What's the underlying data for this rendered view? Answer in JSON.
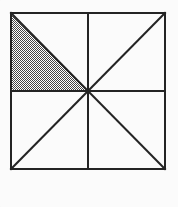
{
  "figure": {
    "name": "shaded-square-eighths",
    "background_color": "#fbfbfb",
    "line_color": "#242424",
    "line_width": 2,
    "shade_fill_color": "#a9a9a9",
    "shade_pattern": "halftone-checker-dither",
    "shade_dot_color": "#3a3a3a",
    "square": {
      "left": 11,
      "top": 13,
      "right": 165,
      "bottom": 169,
      "width": 154,
      "height": 156,
      "center_x": 88,
      "center_y": 91
    },
    "lines": [
      {
        "name": "square-border-top",
        "x1": 11,
        "y1": 13,
        "x2": 165,
        "y2": 13
      },
      {
        "name": "square-border-right",
        "x1": 165,
        "y1": 13,
        "x2": 165,
        "y2": 169
      },
      {
        "name": "square-border-bottom",
        "x1": 11,
        "y1": 169,
        "x2": 165,
        "y2": 169
      },
      {
        "name": "square-border-left",
        "x1": 11,
        "y1": 13,
        "x2": 11,
        "y2": 169
      },
      {
        "name": "horizontal-midline",
        "x1": 11,
        "y1": 91,
        "x2": 165,
        "y2": 91
      },
      {
        "name": "vertical-midline",
        "x1": 88,
        "y1": 13,
        "x2": 88,
        "y2": 169
      },
      {
        "name": "diagonal-tl-br",
        "x1": 11,
        "y1": 13,
        "x2": 165,
        "y2": 169
      },
      {
        "name": "diagonal-bl-tr",
        "x1": 11,
        "y1": 169,
        "x2": 165,
        "y2": 13
      }
    ],
    "shaded_triangle": {
      "name": "shaded-triangle-upper-left-lower-half",
      "quadrant": "upper-left",
      "vertices": [
        {
          "label": "top-left-corner",
          "x": 11,
          "y": 13
        },
        {
          "label": "left-midpoint",
          "x": 11,
          "y": 91
        },
        {
          "label": "square-center",
          "x": 88,
          "y": 91
        }
      ],
      "points": "11,13 11,91 88,91",
      "fraction_of_square": "1/8"
    },
    "triangle_count": 8,
    "shaded_count": 1
  }
}
